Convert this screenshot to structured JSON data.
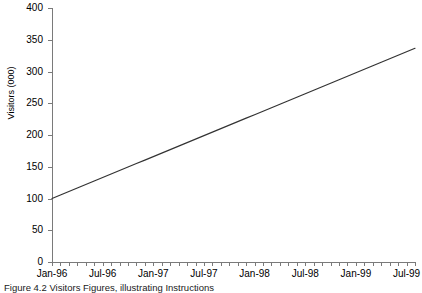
{
  "chart_data": {
    "type": "line",
    "title": "",
    "xlabel": "",
    "ylabel": "Visitors (000)",
    "ylim": [
      0,
      400
    ],
    "ytick_step": 50,
    "yticks": [
      0,
      50,
      100,
      150,
      200,
      250,
      300,
      350,
      400
    ],
    "ytick_labels": [
      "0",
      "50",
      "100",
      "150",
      "200",
      "250",
      "300",
      "350",
      "400"
    ],
    "grid": false,
    "legend": "none",
    "line_color": "#333333",
    "x_minor_tick_count": 43,
    "xtick_labels": [
      "Jan-96",
      "Jul-96",
      "Jan-97",
      "Jul-97",
      "Jan-98",
      "Jul-98",
      "Jan-99",
      "Jul-99"
    ],
    "x": [
      "Jan-96",
      "Feb-96",
      "Mar-96",
      "Apr-96",
      "May-96",
      "Jun-96",
      "Jul-96",
      "Aug-96",
      "Sep-96",
      "Oct-96",
      "Nov-96",
      "Dec-96",
      "Jan-97",
      "Feb-97",
      "Mar-97",
      "Apr-97",
      "May-97",
      "Jun-97",
      "Jul-97",
      "Aug-97",
      "Sep-97",
      "Oct-97",
      "Nov-97",
      "Dec-97",
      "Jan-98",
      "Feb-98",
      "Mar-98",
      "Apr-98",
      "May-98",
      "Jun-98",
      "Jul-98",
      "Aug-98",
      "Sep-98",
      "Oct-98",
      "Nov-98",
      "Dec-98",
      "Jan-99",
      "Feb-99",
      "Mar-99",
      "Apr-99",
      "May-99",
      "Jun-99",
      "Jul-99",
      "Aug-99"
    ],
    "values": [
      100.0,
      105.5,
      111.0,
      116.5,
      122.0,
      127.5,
      133.0,
      138.5,
      144.0,
      149.5,
      155.0,
      160.5,
      166.0,
      171.5,
      177.0,
      182.5,
      188.0,
      193.5,
      199.0,
      204.5,
      210.0,
      215.5,
      221.0,
      226.5,
      232.0,
      237.5,
      243.0,
      248.5,
      254.0,
      259.5,
      265.0,
      270.5,
      276.0,
      281.5,
      287.0,
      292.5,
      298.0,
      303.5,
      309.0,
      314.5,
      320.0,
      325.5,
      331.0,
      336.5
    ]
  },
  "caption": {
    "text": "Figure 4.2  Visitors Figures, illustrating Instructions"
  }
}
